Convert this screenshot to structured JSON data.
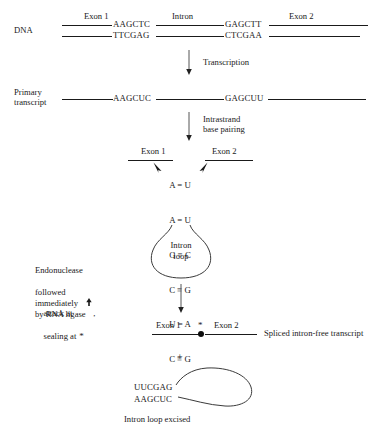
{
  "figure": {
    "ink_color": "#1a1a1a"
  },
  "dna_stage": {
    "row_label": "DNA",
    "exon1_label": "Exon 1",
    "intron_label": "Intron",
    "exon2_label": "Exon 2",
    "top_strand_left": "AAGCTC",
    "top_strand_right": "GAGCTT",
    "bottom_strand_left": "TTCGAG",
    "bottom_strand_right": "CTCGAA"
  },
  "arrow1": {
    "label": "Transcription"
  },
  "transcript_stage": {
    "row_label_line1": "Primary",
    "row_label_line2": "transcript",
    "segment_left": "AAGCUC",
    "segment_right": "GAGCUU"
  },
  "arrow2": {
    "label_line1": "Intrastrand",
    "label_line2": "base pairing"
  },
  "pairing_stage": {
    "exon1_label": "Exon 1",
    "exon2_label": "Exon 2",
    "base_pairs": [
      {
        "left": "A",
        "bond": "=",
        "right": "U"
      },
      {
        "left": "A",
        "bond": "=",
        "right": "U"
      },
      {
        "left": "G",
        "bond": "≡",
        "right": "C"
      },
      {
        "left": "C",
        "bond": "≡",
        "right": "G"
      },
      {
        "left": "U",
        "bond": "=",
        "right": "A"
      },
      {
        "left": "C",
        "bond": "≡",
        "right": "G"
      }
    ],
    "loop_label_line1": "Intron",
    "loop_label_line2": "loop"
  },
  "endonuclease_note": {
    "line1": "Endonuclease",
    "line2": "attack at ⬆,",
    "line2_text": "attack at",
    "line2_arrow": "⬆",
    "line2_tail": ",",
    "line3": "followed",
    "line4": "immediately",
    "line5": "by RNA ligase",
    "line6_text": "sealing at",
    "line6_star": "*"
  },
  "spliced_stage": {
    "exon1_label": "Exon 1",
    "exon2_label": "Exon 2",
    "junction_star": "*",
    "caption": "Spliced intron-free transcript"
  },
  "plus_sign": "+",
  "excised_stage": {
    "top_sequence": "UUCGAG",
    "bottom_sequence": "AAGCUC",
    "caption": "Intron loop excised"
  }
}
